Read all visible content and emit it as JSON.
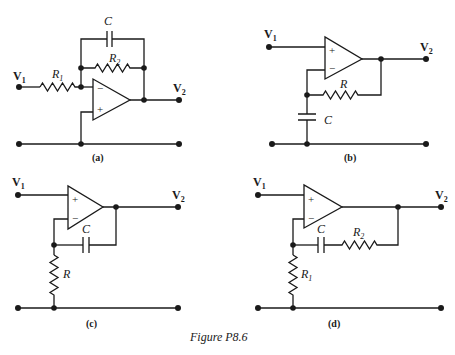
{
  "figure": {
    "caption": "Figure P8.6",
    "panels": [
      {
        "id": "a",
        "label": "(a)",
        "input": {
          "name": "V",
          "sub": "1"
        },
        "output": {
          "name": "V",
          "sub": "2"
        },
        "components": [
          {
            "type": "resistor",
            "name": "R",
            "sub": "1",
            "between": "V1 - inverting input"
          },
          {
            "type": "resistor",
            "name": "R",
            "sub": "2",
            "between": "inverting input - output"
          },
          {
            "type": "capacitor",
            "name": "C",
            "sub": "",
            "between": "inverting input - output"
          }
        ],
        "opamp": {
          "top_input": "−",
          "bottom_input": "+"
        }
      },
      {
        "id": "b",
        "label": "(b)",
        "input": {
          "name": "V",
          "sub": "1"
        },
        "output": {
          "name": "V",
          "sub": "2"
        },
        "components": [
          {
            "type": "resistor",
            "name": "R",
            "sub": "",
            "between": "inverting input - output"
          },
          {
            "type": "capacitor",
            "name": "C",
            "sub": "",
            "between": "inverting input - ground"
          }
        ],
        "opamp": {
          "top_input": "+",
          "bottom_input": "−"
        }
      },
      {
        "id": "c",
        "label": "(c)",
        "input": {
          "name": "V",
          "sub": "1"
        },
        "output": {
          "name": "V",
          "sub": "2"
        },
        "components": [
          {
            "type": "capacitor",
            "name": "C",
            "sub": "",
            "between": "inverting input - output"
          },
          {
            "type": "resistor",
            "name": "R",
            "sub": "",
            "between": "inverting input - ground"
          }
        ],
        "opamp": {
          "top_input": "+",
          "bottom_input": "−"
        }
      },
      {
        "id": "d",
        "label": "(d)",
        "input": {
          "name": "V",
          "sub": "1"
        },
        "output": {
          "name": "V",
          "sub": "2"
        },
        "components": [
          {
            "type": "capacitor",
            "name": "C",
            "sub": "",
            "between": "inverting input - R2"
          },
          {
            "type": "resistor",
            "name": "R",
            "sub": "2",
            "between": "C - output"
          },
          {
            "type": "resistor",
            "name": "R",
            "sub": "1",
            "between": "inverting input - ground"
          }
        ],
        "opamp": {
          "top_input": "+",
          "bottom_input": "−"
        }
      }
    ]
  }
}
